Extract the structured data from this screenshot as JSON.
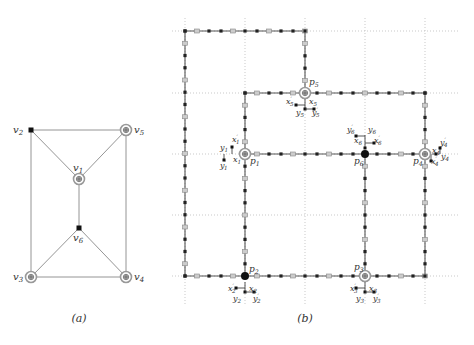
{
  "panel_a": {
    "caption": "(a)",
    "vertices": [
      {
        "id": "v1",
        "label": "v1",
        "x": 79,
        "y": 179,
        "style": "terminal"
      },
      {
        "id": "v2",
        "label": "v2",
        "x": 31,
        "y": 130,
        "style": "dot"
      },
      {
        "id": "v3",
        "label": "v3",
        "x": 31,
        "y": 277,
        "style": "terminal"
      },
      {
        "id": "v4",
        "label": "v4",
        "x": 126,
        "y": 277,
        "style": "terminal"
      },
      {
        "id": "v5",
        "label": "v5",
        "x": 126,
        "y": 130,
        "style": "terminal"
      },
      {
        "id": "v6",
        "label": "v6",
        "x": 79,
        "y": 228,
        "style": "dot"
      }
    ],
    "edges": [
      [
        "v2",
        "v5"
      ],
      [
        "v2",
        "v3"
      ],
      [
        "v5",
        "v4"
      ],
      [
        "v3",
        "v4"
      ],
      [
        "v2",
        "v1"
      ],
      [
        "v5",
        "v1"
      ],
      [
        "v1",
        "v6"
      ],
      [
        "v6",
        "v3"
      ],
      [
        "v6",
        "v4"
      ]
    ]
  },
  "panel_b": {
    "caption": "(b)",
    "grid": {
      "xs": [
        185,
        245,
        305,
        365,
        425
      ],
      "ys": [
        31,
        93,
        154,
        215,
        276
      ]
    },
    "paths": [
      [
        [
          185,
          31
        ],
        [
          305,
          31
        ],
        [
          305,
          93
        ]
      ],
      [
        [
          185,
          31
        ],
        [
          185,
          276
        ],
        [
          245,
          276
        ]
      ],
      [
        [
          245,
          93
        ],
        [
          425,
          93
        ],
        [
          425,
          154
        ]
      ],
      [
        [
          245,
          93
        ],
        [
          245,
          276
        ]
      ],
      [
        [
          245,
          154
        ],
        [
          425,
          154
        ]
      ],
      [
        [
          365,
          154
        ],
        [
          365,
          276
        ]
      ],
      [
        [
          425,
          154
        ],
        [
          425,
          276
        ]
      ],
      [
        [
          245,
          276
        ],
        [
          425,
          276
        ]
      ]
    ],
    "terminals": [
      {
        "label": "p1",
        "x": 245,
        "y": 154,
        "style": "terminal"
      },
      {
        "label": "p2",
        "x": 245,
        "y": 276,
        "style": "big-dot"
      },
      {
        "label": "p3",
        "x": 365,
        "y": 276,
        "style": "terminal"
      },
      {
        "label": "p4",
        "x": 425,
        "y": 154,
        "style": "terminal"
      },
      {
        "label": "p5",
        "x": 305,
        "y": 93,
        "style": "terminal"
      },
      {
        "label": "p6",
        "x": 365,
        "y": 154,
        "style": "big-dot"
      }
    ],
    "gadget_labels": [
      {
        "text": "x'1",
        "x": 232,
        "y": 142
      },
      {
        "text": "x1",
        "x": 233,
        "y": 162
      },
      {
        "text": "y1",
        "x": 220,
        "y": 150
      },
      {
        "text": "y'1",
        "x": 220,
        "y": 168
      },
      {
        "text": "x'2",
        "x": 228,
        "y": 291
      },
      {
        "text": "x2",
        "x": 249,
        "y": 291
      },
      {
        "text": "y2",
        "x": 233,
        "y": 301
      },
      {
        "text": "y'2",
        "x": 253,
        "y": 301
      },
      {
        "text": "x'3",
        "x": 350,
        "y": 291
      },
      {
        "text": "x3",
        "x": 369,
        "y": 291
      },
      {
        "text": "y3",
        "x": 356,
        "y": 301
      },
      {
        "text": "y'3",
        "x": 373,
        "y": 301
      },
      {
        "text": "x4",
        "x": 432,
        "y": 153
      },
      {
        "text": "x'4",
        "x": 431,
        "y": 164
      },
      {
        "text": "y'4",
        "x": 440,
        "y": 145
      },
      {
        "text": "y4",
        "x": 441,
        "y": 159
      },
      {
        "text": "x'5",
        "x": 286,
        "y": 104
      },
      {
        "text": "x5",
        "x": 309,
        "y": 104
      },
      {
        "text": "y5",
        "x": 296,
        "y": 115
      },
      {
        "text": "y'5",
        "x": 312,
        "y": 115
      },
      {
        "text": "y'6",
        "x": 347,
        "y": 132
      },
      {
        "text": "y6",
        "x": 368,
        "y": 132
      },
      {
        "text": "x6",
        "x": 354,
        "y": 143
      },
      {
        "text": "x'6",
        "x": 374,
        "y": 143
      }
    ],
    "terminal_labels": [
      {
        "text": "p1",
        "x": 250,
        "y": 164
      },
      {
        "text": "p2",
        "x": 249,
        "y": 272
      },
      {
        "text": "p3",
        "x": 354,
        "y": 270
      },
      {
        "text": "p4",
        "x": 413,
        "y": 164
      },
      {
        "text": "p5",
        "x": 309,
        "y": 85
      },
      {
        "text": "p6",
        "x": 354,
        "y": 164
      }
    ]
  }
}
